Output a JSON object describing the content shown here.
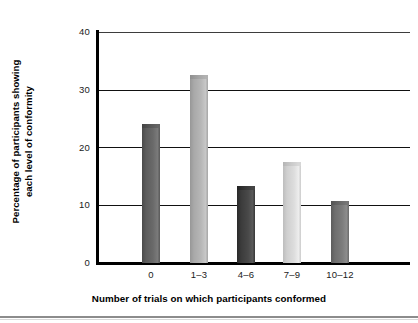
{
  "chart_data": {
    "type": "bar",
    "title": "",
    "xlabel": "Number of trials on which participants conformed",
    "ylabel": "Percentage of participants showing each level of conformity",
    "ylabel_line1": "Percentage of participants showing",
    "ylabel_line2": "each level of conformity",
    "categories": [
      "0",
      "1–3",
      "4–6",
      "7–9",
      "10–12"
    ],
    "values": [
      24,
      32.5,
      13.3,
      17.5,
      10.7
    ],
    "ylim": [
      0,
      40
    ],
    "yticks": [
      0,
      10,
      20,
      30,
      40
    ],
    "ytick_labels": [
      "0",
      "10",
      "20",
      "30",
      "40"
    ],
    "xlim_labels": [
      "0",
      "1–3",
      "4–6",
      "7–9",
      "10–12"
    ],
    "grid": "horizontal",
    "legend": "none",
    "bar_colors": [
      "#5c5c5c",
      "#a9a9a9",
      "#3b3b3b",
      "#cfcfcf",
      "#6e6e6e"
    ],
    "axis_color": "#000000",
    "gridline_color": "#111111",
    "background": "#ffffff"
  },
  "axes": {
    "y_axis_name": "y-axis",
    "x_axis_name": "x-axis"
  }
}
